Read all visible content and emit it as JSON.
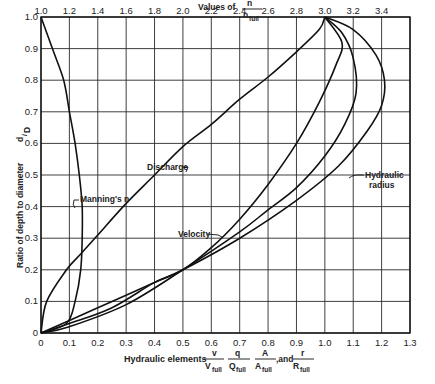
{
  "chart_data": {
    "type": "line",
    "title": "",
    "xlabel": "Hydraulic elements v/V_full, q/Q_full, A/A_full, and r/R_full",
    "ylabel": "Ratio of depth to diameter d/D",
    "x2label": "Values of n/n_full",
    "xlim": [
      0,
      1.3
    ],
    "ylim": [
      0,
      1.0
    ],
    "x2lim": [
      1.0,
      3.6
    ],
    "grid": true,
    "x_ticks": [
      "0",
      "0.1",
      "0.2",
      "0.3",
      "0.4",
      "0.5",
      "0.6",
      "0.7",
      "0.8",
      "0.9",
      "1.0",
      "1.1",
      "1.2",
      "1.3"
    ],
    "y_ticks": [
      "0",
      "0.1",
      "0.2",
      "0.3",
      "0.4",
      "0.5",
      "0.6",
      "0.7",
      "0.8",
      "0.9",
      "1.0"
    ],
    "x2_ticks": [
      "1.0",
      "1.2",
      "1.4",
      "1.6",
      "1.8",
      "2.0",
      "2.2",
      "2.4",
      "2.6",
      "2.8",
      "3.0",
      "3.2",
      "3.4"
    ],
    "series": [
      {
        "name": "Manning's n",
        "axis": "top",
        "points": [
          [
            1.0,
            1.0
          ],
          [
            1.08,
            0.9
          ],
          [
            1.16,
            0.8
          ],
          [
            1.2,
            0.7
          ],
          [
            1.24,
            0.6
          ],
          [
            1.27,
            0.5
          ],
          [
            1.29,
            0.4
          ],
          [
            1.29,
            0.3
          ],
          [
            1.28,
            0.2
          ],
          [
            1.24,
            0.1
          ],
          [
            1.18,
            0.03
          ],
          [
            1.0,
            0.0
          ]
        ]
      },
      {
        "name": "Discharge",
        "axis": "bottom",
        "points": [
          [
            0,
            0
          ],
          [
            0.02,
            0.1
          ],
          [
            0.09,
            0.2
          ],
          [
            0.14,
            0.25
          ],
          [
            0.2,
            0.31
          ],
          [
            0.3,
            0.41
          ],
          [
            0.4,
            0.5
          ],
          [
            0.5,
            0.59
          ],
          [
            0.6,
            0.66
          ],
          [
            0.7,
            0.74
          ],
          [
            0.8,
            0.81
          ],
          [
            0.9,
            0.89
          ],
          [
            0.98,
            0.96
          ],
          [
            1.0,
            1.0
          ]
        ]
      },
      {
        "name": "Velocity",
        "axis": "bottom",
        "points": [
          [
            0,
            0
          ],
          [
            0.1,
            0.04
          ],
          [
            0.25,
            0.1
          ],
          [
            0.4,
            0.16
          ],
          [
            0.5,
            0.2
          ],
          [
            0.6,
            0.27
          ],
          [
            0.7,
            0.36
          ],
          [
            0.8,
            0.47
          ],
          [
            0.9,
            0.6
          ],
          [
            0.98,
            0.73
          ],
          [
            1.04,
            0.85
          ],
          [
            1.06,
            0.92
          ],
          [
            1.0,
            1.0
          ]
        ]
      },
      {
        "name": "Area",
        "axis": "bottom",
        "points": [
          [
            0,
            0
          ],
          [
            0.1,
            0.02
          ],
          [
            0.3,
            0.09
          ],
          [
            0.5,
            0.2
          ],
          [
            0.7,
            0.32
          ],
          [
            0.8,
            0.39
          ],
          [
            0.9,
            0.46
          ],
          [
            1.0,
            0.56
          ],
          [
            1.07,
            0.66
          ],
          [
            1.11,
            0.76
          ],
          [
            1.1,
            0.87
          ],
          [
            1.06,
            0.95
          ],
          [
            1.0,
            1.0
          ]
        ]
      },
      {
        "name": "Hydraulic radius",
        "axis": "bottom",
        "points": [
          [
            0,
            0
          ],
          [
            0.1,
            0.03
          ],
          [
            0.25,
            0.08
          ],
          [
            0.4,
            0.16
          ],
          [
            0.5,
            0.2
          ],
          [
            0.7,
            0.3
          ],
          [
            0.9,
            0.42
          ],
          [
            1.05,
            0.53
          ],
          [
            1.15,
            0.64
          ],
          [
            1.2,
            0.72
          ],
          [
            1.21,
            0.8
          ],
          [
            1.18,
            0.88
          ],
          [
            1.1,
            0.96
          ],
          [
            1.0,
            1.0
          ]
        ]
      }
    ],
    "annotations": [
      "Manning's n",
      "Discharge",
      "Velocity",
      "Hydraulic radius"
    ]
  },
  "labels": {
    "top_axis_title": "Values of",
    "top_frac_num": "n",
    "top_frac_den": "n",
    "top_frac_den_sub": "full",
    "y_axis_title": "Ratio of depth to diameter",
    "y_frac_num": "d",
    "y_frac_den": "D",
    "x_axis_prefix": "Hydraulic elements",
    "x_f1_num": "v",
    "x_f1_den": "V",
    "x_f2_num": "q",
    "x_f2_den": "Q",
    "x_f3_num": "A",
    "x_f3_den": "A",
    "x_f4_num": "r",
    "x_f4_den": "R",
    "sub_full": "full",
    "and": ",and",
    "manning": "Manning's n",
    "discharge": "Discharge",
    "velocity": "Velocity",
    "hydraulic1": "Hydraulic",
    "hydraulic2": "radius"
  }
}
